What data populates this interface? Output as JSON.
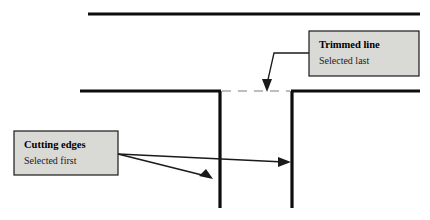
{
  "figure": {
    "background_color": "#ffffff"
  },
  "colors": {
    "line_solid": "#0d0d0d",
    "line_dashed": "#a8a8a4",
    "callout_fill": "#d9d9d6",
    "callout_border": "#1a1a1a",
    "leader": "#1a1a1a",
    "text": "#000000"
  },
  "callouts": [
    {
      "id": "trimmed-line",
      "title": "Trimmed line",
      "subtitle": "Selected last",
      "box": {
        "x": 309,
        "y": 31,
        "width": 110,
        "height": 45
      },
      "title_pos": {
        "x": 319,
        "y": 48
      },
      "subtitle_pos": {
        "x": 319,
        "y": 64
      },
      "leader_path": "M 309 53 L 274 53 L 267 84",
      "arrow_points": "267,92 262,79 272,79"
    },
    {
      "id": "cutting-edges",
      "title": "Cutting edges",
      "subtitle": "Selected first",
      "box": {
        "x": 14,
        "y": 131,
        "width": 104,
        "height": 44
      },
      "title_pos": {
        "x": 24,
        "y": 148
      },
      "subtitle_pos": {
        "x": 24,
        "y": 164
      },
      "leaders": [
        {
          "id": "to-right-edge",
          "path": "M 118 154 L 284 162"
        },
        {
          "id": "to-left-edge",
          "path": "M 118 154 L 206 176"
        }
      ],
      "arrows": [
        {
          "id": "arrow-right-edge",
          "points": "291,162 278,157 278,167"
        },
        {
          "id": "arrow-left-edge",
          "points": "213,179 199,176 206,169"
        }
      ]
    }
  ],
  "geometry": {
    "top_line": {
      "id": "top-horizontal",
      "x1": 88,
      "y1": 14,
      "x2": 420,
      "y2": 14
    },
    "middle_line_left": {
      "id": "middle-horizontal-left",
      "x1": 80,
      "y1": 91,
      "x2": 221,
      "y2": 91
    },
    "middle_line_right": {
      "id": "middle-horizontal-right",
      "x1": 291,
      "y1": 91,
      "x2": 420,
      "y2": 91
    },
    "dashed_segment": {
      "id": "trimmed-segment",
      "x1": 222,
      "y1": 91,
      "x2": 290,
      "y2": 91
    },
    "vertical_left": {
      "id": "vertical-cutting-edge-left",
      "x1": 220,
      "y1": 91,
      "x2": 220,
      "y2": 208
    },
    "vertical_right": {
      "id": "vertical-cutting-edge-right",
      "x1": 292,
      "y1": 91,
      "x2": 292,
      "y2": 208
    }
  }
}
